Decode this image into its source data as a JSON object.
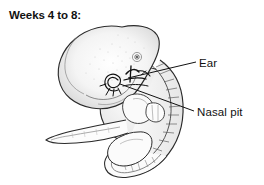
{
  "figure": {
    "title": "Weeks 4 to 8:",
    "background_color": "#ffffff",
    "ink_color": "#111111",
    "shading_color": "#b9b9b9",
    "labels": [
      {
        "id": "ear",
        "text": "Ear",
        "icon": "leader-line"
      },
      {
        "id": "nasal_pit",
        "text": "Nasal pit",
        "icon": "leader-line"
      }
    ],
    "anatomy": [
      {
        "name": "head",
        "description": "large rounded cranial mass upper left"
      },
      {
        "name": "eye",
        "description": "small circular optic placode spot"
      },
      {
        "name": "nasal-pit",
        "description": "dark spiral depression below eye"
      },
      {
        "name": "ear",
        "description": "otic pit marks behind nasal pit"
      },
      {
        "name": "forelimb-bud",
        "description": "tapering paddle extending to lower left"
      },
      {
        "name": "heart-bulge",
        "description": "rounded prominence below head"
      },
      {
        "name": "hand-plate",
        "description": "small lobed plate at limb tip"
      },
      {
        "name": "somites",
        "description": "segmented ridges along curving back"
      },
      {
        "name": "tail",
        "description": "curled caudal end at bottom"
      }
    ]
  }
}
